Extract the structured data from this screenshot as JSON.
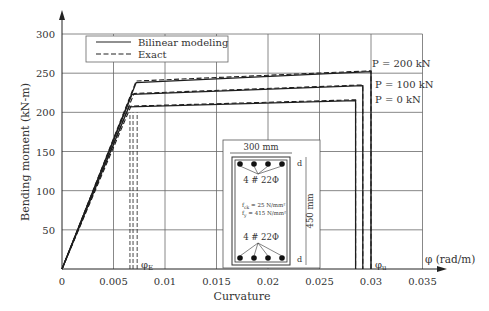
{
  "chart_data": {
    "type": "line",
    "title": "",
    "xlabel": "Curvature",
    "ylabel": "Bending moment (kN-m)",
    "x_axis_symbol": "φ (rad/m)",
    "xlim": [
      0,
      0.035
    ],
    "ylim": [
      0,
      300
    ],
    "xticks": [
      0,
      0.005,
      0.01,
      0.015,
      0.02,
      0.025,
      0.03,
      0.035
    ],
    "xtick_labels": [
      "0",
      "0.005",
      "0.01",
      "0.015",
      "0.02",
      "0.025",
      "0.03",
      "0.035"
    ],
    "yticks": [
      50,
      100,
      150,
      200,
      250,
      300
    ],
    "ytick_labels": [
      "50",
      "100",
      "150",
      "200",
      "250",
      "300"
    ],
    "grid": true,
    "legend": {
      "position": "upper-left",
      "entries": [
        {
          "label": "Bilinear modeling",
          "style": "solid"
        },
        {
          "label": "Exact",
          "style": "dashed"
        }
      ]
    },
    "series": [
      {
        "name": "Bilinear modeling, P = 200 kN",
        "style": "solid",
        "x": [
          0,
          0.0072,
          0.03,
          0.03
        ],
        "y": [
          0,
          238,
          252,
          0
        ]
      },
      {
        "name": "Exact, P = 200 kN",
        "style": "dashed",
        "x": [
          0,
          0.0072,
          0.03,
          0.03
        ],
        "y": [
          0,
          240,
          253,
          0
        ]
      },
      {
        "name": "Bilinear modeling, P = 100 kN",
        "style": "solid",
        "x": [
          0,
          0.0068,
          0.0292,
          0.0292
        ],
        "y": [
          0,
          223,
          234,
          0
        ]
      },
      {
        "name": "Exact, P = 100 kN",
        "style": "dashed",
        "x": [
          0,
          0.007,
          0.0292,
          0.0292
        ],
        "y": [
          0,
          224,
          235,
          0
        ]
      },
      {
        "name": "Bilinear modeling, P = 0 kN",
        "style": "solid",
        "x": [
          0,
          0.0065,
          0.0285,
          0.0285
        ],
        "y": [
          0,
          207,
          215,
          0
        ]
      },
      {
        "name": "Exact, P = 0 kN",
        "style": "dashed",
        "x": [
          0,
          0.0067,
          0.0285,
          0.0285
        ],
        "y": [
          0,
          208,
          216,
          0
        ]
      }
    ],
    "annotations": [
      {
        "text": "P = 200 kN",
        "x": 0.03,
        "y": 262
      },
      {
        "text": "P = 100 kN",
        "x": 0.0302,
        "y": 235
      },
      {
        "text": "P = 0 kN",
        "x": 0.0302,
        "y": 216
      },
      {
        "text": "φE",
        "x": 0.0075,
        "y": 12
      },
      {
        "text": "φu",
        "x": 0.0302,
        "y": 12
      }
    ],
    "inset": {
      "description": "Beam cross-section",
      "width_label": "300 mm",
      "height_label": "450 mm",
      "top_reinforcement": "4 # 22Φ",
      "bottom_reinforcement": "4 # 22Φ",
      "fck": "f_ck = 25 N/mm²",
      "fy": "f_y = 415 N/mm²",
      "cover_label": "d"
    }
  },
  "labels": {
    "xlabel": "Curvature",
    "ylabel": "Bending moment (kN-m)",
    "x_symbol": "φ (rad/m)",
    "legend_solid": "Bilinear modeling",
    "legend_dashed": "Exact",
    "p200": "P = 200 kN",
    "p100": "P = 100 kN",
    "p0": "P = 0 kN",
    "phiE": "φ",
    "phiE_sub": "E",
    "phiU": "φ",
    "phiU_sub": "u",
    "inset_width": "300 mm",
    "inset_height": "450 mm",
    "inset_top": "4 # 22Φ",
    "inset_bottom": "4 # 22Φ",
    "inset_fck_pre": "f",
    "inset_fck_sub": "ck",
    "inset_fck_post": " = 25 N/mm²",
    "inset_fy_pre": "f",
    "inset_fy_sub": "y",
    "inset_fy_post": " = 415 N/mm²",
    "inset_d": "d"
  }
}
